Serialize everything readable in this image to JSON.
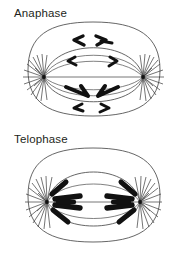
{
  "figure": {
    "background_color": "#ffffff",
    "line_color": "#3a3a3a",
    "chromosome_color": "#111111",
    "width": 187,
    "height": 253
  },
  "panels": [
    {
      "id": "anaphase",
      "label": "Anaphase",
      "description": "Cell with two spindle poles and V-shaped chromosomes migrating toward opposite poles",
      "parts": {
        "cell_membrane": "cell-membrane-outline",
        "spindle_envelope": "spindle-envelope",
        "left_pole": "left-spindle-pole",
        "right_pole": "right-spindle-pole",
        "equator_line": "spindle-equator-line",
        "chromosomes": "chromosomes-group"
      },
      "chromosome_count": 8
    },
    {
      "id": "telophase",
      "label": "Telophase",
      "description": "Cell with chromosomes clustered at each spindle pole as nuclei reform",
      "parts": {
        "cell_membrane": "cell-membrane-outline",
        "spindle_envelope": "spindle-envelope",
        "left_pole": "left-spindle-pole",
        "right_pole": "right-spindle-pole",
        "equator_line": "spindle-equator-line",
        "chromosomes": "chromosomes-group"
      },
      "chromosome_count": 8
    }
  ]
}
